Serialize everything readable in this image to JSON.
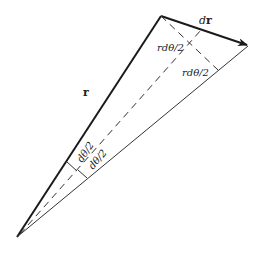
{
  "diagram": {
    "type": "vector-triangle",
    "points": {
      "apex": [
        17,
        237
      ],
      "top_vertex": [
        161,
        16
      ],
      "arrow_tip": [
        248,
        46
      ],
      "bisector_end": [
        201,
        30
      ],
      "perp_foot": [
        218,
        70
      ]
    },
    "labels": {
      "r": "r",
      "dr": "dr",
      "rdtheta_upper": "rdθ/2",
      "rdtheta_lower": "rdθ/2",
      "dtheta_upper": "dθ/2",
      "dtheta_lower": "dθ/2"
    },
    "colors": {
      "line": "#1a1a1a",
      "thin_line": "#333333",
      "background": "#ffffff"
    }
  }
}
